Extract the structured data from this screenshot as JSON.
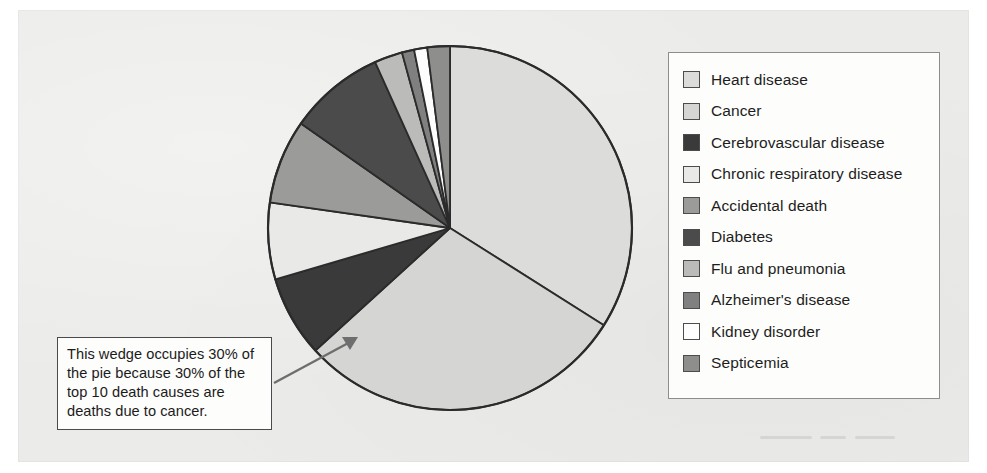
{
  "figure": {
    "kind": "pie-chart-figure",
    "background_color": "#ebebe9",
    "panel_border_color": "#e4e4e2"
  },
  "callout": {
    "text": "This wedge occupies 30% of the pie because 30% of the top 10 death causes are deaths due to cancer.",
    "points_to": "Cancer",
    "border_color": "#4a4a4a",
    "background_color": "#fdfdfc",
    "arrow_color": "#6e6e6e"
  },
  "legend": {
    "position": "right",
    "border_color": "#8d8d8b",
    "background_color": "#fdfdfc",
    "items": [
      {
        "label": "Heart disease",
        "color": "#dcdcda"
      },
      {
        "label": "Cancer",
        "color": "#d5d5d3"
      },
      {
        "label": "Cerebrovascular disease",
        "color": "#3a3a3a"
      },
      {
        "label": "Chronic respiratory disease",
        "color": "#e9e9e7"
      },
      {
        "label": "Accidental death",
        "color": "#9b9b99"
      },
      {
        "label": "Diabetes",
        "color": "#4b4b4b"
      },
      {
        "label": "Flu and pneumonia",
        "color": "#bbbbb9"
      },
      {
        "label": "Alzheimer's disease",
        "color": "#808080"
      },
      {
        "label": "Kidney disorder",
        "color": "#fdfdfd"
      },
      {
        "label": "Septicemia",
        "color": "#8e8e8c"
      }
    ]
  },
  "chart_data": {
    "type": "pie",
    "title": "",
    "subtitle": "",
    "xlabel": "",
    "ylabel": "",
    "grid": false,
    "legend_position": "right",
    "start_angle_deg": 0,
    "direction": "clockwise",
    "units": "percent",
    "center": {
      "x": 450,
      "y": 228
    },
    "radius": 182,
    "outline_color": "#2b2b2b",
    "categories": [
      "Heart disease",
      "Cancer",
      "Cerebrovascular disease",
      "Chronic respiratory disease",
      "Accidental death",
      "Diabetes",
      "Flu and pneumonia",
      "Alzheimer's disease",
      "Kidney disorder",
      "Septicemia"
    ],
    "values": [
      34,
      30,
      7.3,
      6.7,
      7.5,
      8.6,
      2.5,
      1.2,
      1.2,
      2.0
    ],
    "slices": [
      {
        "label": "Heart disease",
        "value": 34,
        "start_deg": 0,
        "end_deg": 122.3,
        "color": "#dcdcda"
      },
      {
        "label": "Cancer",
        "value": 30,
        "start_deg": 122.3,
        "end_deg": 227.7,
        "color": "#d5d5d3"
      },
      {
        "label": "Cerebrovascular disease",
        "value": 7.3,
        "start_deg": 227.7,
        "end_deg": 253.6,
        "color": "#3a3a3a"
      },
      {
        "label": "Chronic respiratory disease",
        "value": 6.7,
        "start_deg": 253.6,
        "end_deg": 278.1,
        "color": "#e9e9e7"
      },
      {
        "label": "Accidental death",
        "value": 7.5,
        "start_deg": 278.1,
        "end_deg": 305.0,
        "color": "#9b9b99"
      },
      {
        "label": "Diabetes",
        "value": 8.6,
        "start_deg": 305.0,
        "end_deg": 335.7,
        "color": "#4b4b4b"
      },
      {
        "label": "Flu and pneumonia",
        "value": 2.5,
        "start_deg": 335.7,
        "end_deg": 344.7,
        "color": "#bbbbb9"
      },
      {
        "label": "Alzheimer's disease",
        "value": 1.2,
        "start_deg": 344.7,
        "end_deg": 348.6,
        "color": "#808080"
      },
      {
        "label": "Kidney disorder",
        "value": 1.2,
        "start_deg": 348.6,
        "end_deg": 352.8,
        "color": "#fdfdfd"
      },
      {
        "label": "Septicemia",
        "value": 2.0,
        "start_deg": 352.8,
        "end_deg": 360.0,
        "color": "#8e8e8c"
      }
    ],
    "annotations": [
      {
        "text": "This wedge occupies 30% of the pie because 30% of the top 10 death causes are deaths due to cancer.",
        "target_slice": "Cancer"
      }
    ]
  }
}
